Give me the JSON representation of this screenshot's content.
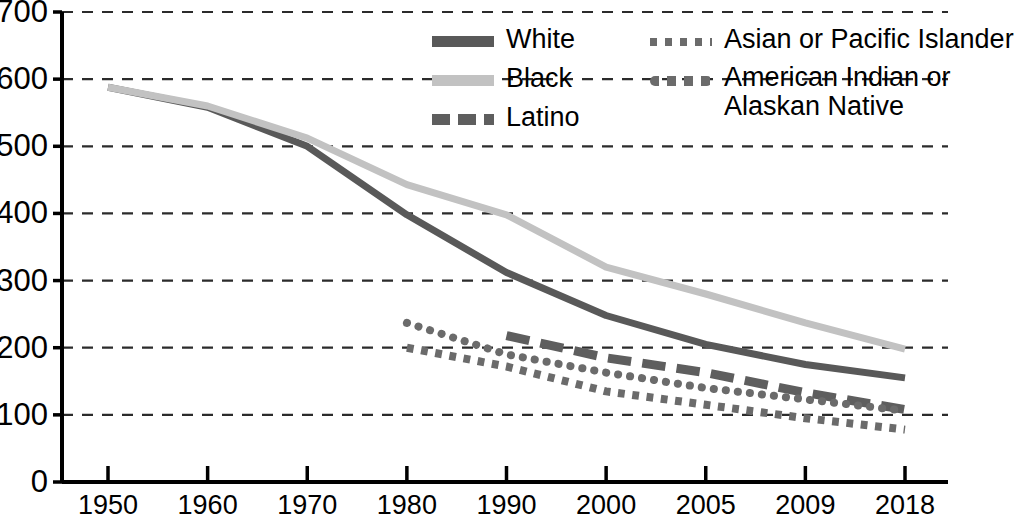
{
  "chart_data": {
    "type": "line",
    "title": "",
    "subtitle": "",
    "xlabel": "",
    "ylabel": "",
    "categories": [
      "1950",
      "1960",
      "1970",
      "1980",
      "1990",
      "2000",
      "2005",
      "2009",
      "2018"
    ],
    "ylim": [
      0,
      700
    ],
    "ytick_labels": [
      "0",
      "100",
      "200",
      "300",
      "400",
      "500",
      "600",
      "700"
    ],
    "ytick_values": [
      0,
      100,
      200,
      300,
      400,
      500,
      600,
      700
    ],
    "grid": true,
    "grid_style": "horizontal-dashed",
    "legend_position": "top-right",
    "series": [
      {
        "name": "White",
        "color": "#595959",
        "style": "solid",
        "width": 7,
        "values": [
          588,
          558,
          500,
          398,
          312,
          248,
          205,
          175,
          155
        ]
      },
      {
        "name": "Black",
        "color": "#c2c2c2",
        "style": "solid",
        "width": 7,
        "values": [
          588,
          560,
          512,
          443,
          398,
          320,
          280,
          237,
          198
        ]
      },
      {
        "name": "Latino",
        "color": "#5e5e5e",
        "style": "dashed",
        "width": 9,
        "values": [
          null,
          null,
          null,
          null,
          218,
          185,
          163,
          133,
          108
        ]
      },
      {
        "name": "Asian or Pacific Islander",
        "color": "#6b6b6b",
        "style": "dotted-square",
        "width": 8,
        "values": [
          null,
          null,
          null,
          200,
          172,
          135,
          115,
          95,
          78
        ]
      },
      {
        "name": "American Indian or Alaskan Native",
        "color": "#6b6b6b",
        "style": "dotted-round",
        "width": 8,
        "values": [
          null,
          null,
          null,
          237,
          190,
          163,
          140,
          123,
          106
        ]
      }
    ]
  },
  "legend": {
    "columns": [
      {
        "entries": [
          {
            "label": "White",
            "swatch": "solid-dark"
          },
          {
            "label": "Black",
            "swatch": "solid-light"
          },
          {
            "label": "Latino",
            "swatch": "dashed-dark"
          }
        ]
      },
      {
        "entries": [
          {
            "label": "Asian or Pacific Islander",
            "swatch": "dotted-square"
          },
          {
            "label": "American Indian or",
            "label2": "Alaskan Native",
            "swatch": "dotted-round"
          }
        ]
      }
    ]
  },
  "axes": {
    "y_labels": [
      "700",
      "600",
      "500",
      "400",
      "300",
      "200",
      "100",
      "0"
    ],
    "x_labels": [
      "1950",
      "1960",
      "1970",
      "1980",
      "1990",
      "2000",
      "2005",
      "2009",
      "2018"
    ]
  },
  "colors": {
    "white_series": "#595959",
    "black_series": "#c2c2c2",
    "latino_series": "#5e5e5e",
    "dotted_series": "#6b6b6b",
    "axis": "#000000",
    "grid": "#2b2b2b",
    "background": "#ffffff"
  }
}
